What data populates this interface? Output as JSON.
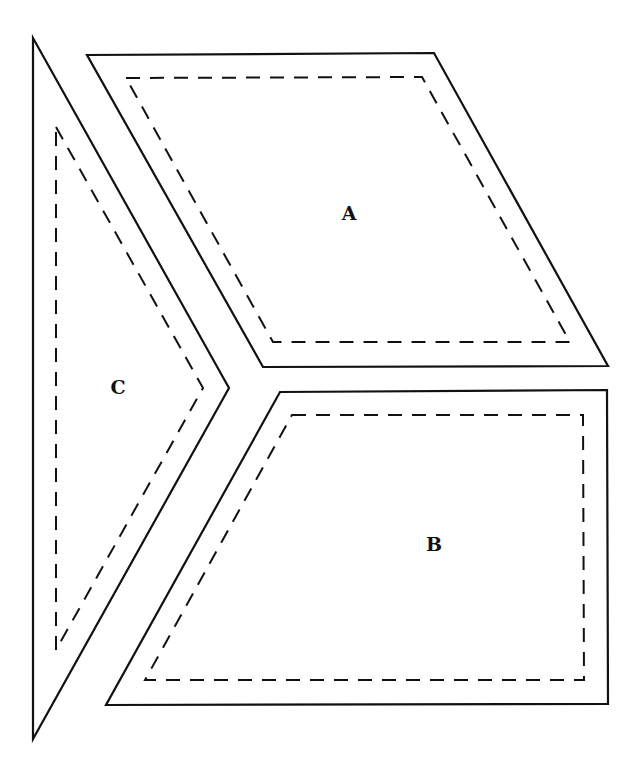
{
  "diagram": {
    "type": "pattern-pieces",
    "pieces": [
      {
        "label": "A",
        "label_pos": [
          349,
          213
        ],
        "outline": "87,55 434,53 608,366 263,367",
        "seam": "126,78 422,77 570,342 273,342"
      },
      {
        "label": "B",
        "label_pos": [
          434,
          544
        ],
        "outline": "280,392 607,390 608,704 106,705",
        "seam": "292,415 583,415 584,680 145,680"
      },
      {
        "label": "C",
        "label_pos": [
          118,
          387
        ],
        "outline": "33,38 229,388 33,739",
        "seam": "56,127 203,388 56,650"
      }
    ],
    "colors": {
      "line": "#111111",
      "background": "#ffffff"
    }
  }
}
